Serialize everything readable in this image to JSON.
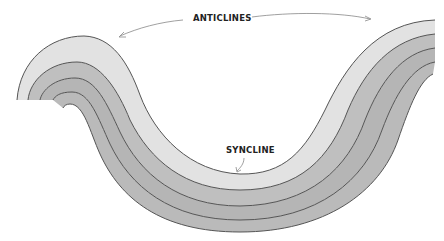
{
  "diagram": {
    "type": "geologic-fold-cross-section",
    "labels": {
      "anticlines": "ANTICLINES",
      "syncline": "SYNCLINE"
    },
    "layers": [
      {
        "name": "top-layer",
        "color": "#e2e2e2"
      },
      {
        "name": "layer-2",
        "color": "#bdbdbd"
      },
      {
        "name": "layer-3",
        "color": "#b4b4b4"
      },
      {
        "name": "layer-4",
        "color": "#b9b9b9"
      }
    ],
    "colors": {
      "outline": "#555555",
      "arrow": "#888888",
      "background": "#ffffff"
    }
  }
}
